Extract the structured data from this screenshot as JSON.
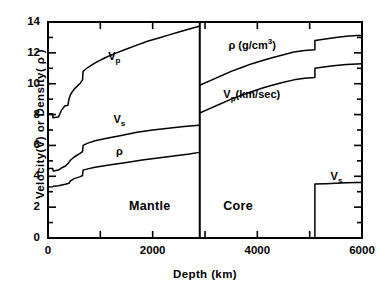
{
  "chart_data": {
    "type": "line",
    "title": "",
    "xlabel": "Depth  (km)",
    "ylabel": "Velocity(V) or Density( ρ )",
    "xlim": [
      0,
      6000
    ],
    "ylim": [
      0,
      14
    ],
    "grid": false,
    "legend": "inline-annotations",
    "xticks_major": [
      0,
      2000,
      4000,
      6000
    ],
    "xtick_labels": [
      "0",
      "2000",
      "4000",
      "6000"
    ],
    "xticks_minor": [
      1000,
      3000,
      5000
    ],
    "yticks_major": [
      0,
      2,
      4,
      6,
      8,
      10,
      12,
      14
    ],
    "ytick_labels": [
      "0",
      "2",
      "4",
      "6",
      "8",
      "10",
      "12",
      "14"
    ],
    "yticks_minor": [
      1,
      3,
      5,
      7,
      9,
      11,
      13
    ],
    "annotations": [
      {
        "name": "vp-mantle-label",
        "text": "V",
        "sub": "p",
        "x": 1150,
        "y": 11.7
      },
      {
        "name": "vs-mantle-label",
        "text": "V",
        "sub": "s",
        "x": 1250,
        "y": 7.6
      },
      {
        "name": "rho-mantle-label",
        "text": "ρ",
        "x": 1300,
        "y": 5.5
      },
      {
        "name": "rho-core-label",
        "text": "ρ (g/cm",
        "sup": "3",
        "suffix": ")",
        "x": 3450,
        "y": 12.5
      },
      {
        "name": "vp-core-label",
        "text": "V",
        "sub": "p",
        "suffix": "(km/sec)",
        "x": 3350,
        "y": 9.2
      },
      {
        "name": "vs-core-label",
        "text": "V",
        "sub": "s",
        "x": 5400,
        "y": 3.9
      },
      {
        "name": "mantle-region-label",
        "text": "Mantle",
        "x": 1550,
        "y": 2.0
      },
      {
        "name": "core-region-label",
        "text": "Core",
        "x": 3350,
        "y": 2.0
      }
    ],
    "boundaries": {
      "mantle_core_km": 2900,
      "inner_core_km": 5100
    },
    "series": [
      {
        "name": "Vp mantle",
        "symbol": "Vp",
        "region": "mantle",
        "unit": "km/sec",
        "points": [
          [
            0,
            8.05
          ],
          [
            90,
            8.05
          ],
          [
            95,
            7.8
          ],
          [
            200,
            7.85
          ],
          [
            260,
            8.3
          ],
          [
            320,
            8.55
          ],
          [
            380,
            8.6
          ],
          [
            400,
            9.0
          ],
          [
            430,
            9.3
          ],
          [
            500,
            9.65
          ],
          [
            620,
            10.05
          ],
          [
            660,
            10.25
          ],
          [
            670,
            10.8
          ],
          [
            760,
            11.05
          ],
          [
            900,
            11.35
          ],
          [
            1100,
            11.7
          ],
          [
            1300,
            11.98
          ],
          [
            1500,
            12.25
          ],
          [
            1700,
            12.5
          ],
          [
            1900,
            12.75
          ],
          [
            2100,
            12.95
          ],
          [
            2300,
            13.15
          ],
          [
            2500,
            13.35
          ],
          [
            2700,
            13.55
          ],
          [
            2890,
            13.72
          ]
        ]
      },
      {
        "name": "Vs mantle",
        "symbol": "Vs",
        "region": "mantle",
        "unit": "km/sec",
        "points": [
          [
            0,
            4.5
          ],
          [
            90,
            4.5
          ],
          [
            100,
            4.35
          ],
          [
            200,
            4.4
          ],
          [
            260,
            4.55
          ],
          [
            330,
            4.65
          ],
          [
            400,
            4.9
          ],
          [
            430,
            5.05
          ],
          [
            500,
            5.25
          ],
          [
            620,
            5.5
          ],
          [
            660,
            5.6
          ],
          [
            670,
            6.0
          ],
          [
            760,
            6.15
          ],
          [
            900,
            6.3
          ],
          [
            1100,
            6.45
          ],
          [
            1400,
            6.65
          ],
          [
            1700,
            6.85
          ],
          [
            2000,
            7.0
          ],
          [
            2300,
            7.12
          ],
          [
            2600,
            7.22
          ],
          [
            2890,
            7.3
          ]
        ]
      },
      {
        "name": "rho mantle",
        "symbol": "ρ",
        "region": "mantle",
        "unit": "g/cm3",
        "points": [
          [
            0,
            3.3
          ],
          [
            90,
            3.32
          ],
          [
            100,
            3.35
          ],
          [
            200,
            3.38
          ],
          [
            330,
            3.48
          ],
          [
            400,
            3.55
          ],
          [
            430,
            3.7
          ],
          [
            500,
            3.85
          ],
          [
            620,
            3.98
          ],
          [
            660,
            4.05
          ],
          [
            670,
            4.4
          ],
          [
            760,
            4.48
          ],
          [
            900,
            4.58
          ],
          [
            1200,
            4.75
          ],
          [
            1500,
            4.9
          ],
          [
            1800,
            5.05
          ],
          [
            2100,
            5.18
          ],
          [
            2400,
            5.32
          ],
          [
            2700,
            5.45
          ],
          [
            2890,
            5.55
          ]
        ]
      },
      {
        "name": "rho core",
        "symbol": "ρ",
        "region": "core",
        "unit": "g/cm3",
        "points": [
          [
            2900,
            9.9
          ],
          [
            3100,
            10.2
          ],
          [
            3300,
            10.5
          ],
          [
            3500,
            10.8
          ],
          [
            3700,
            11.05
          ],
          [
            3900,
            11.3
          ],
          [
            4100,
            11.5
          ],
          [
            4300,
            11.7
          ],
          [
            4500,
            11.88
          ],
          [
            4700,
            12.05
          ],
          [
            4900,
            12.15
          ],
          [
            5100,
            12.2
          ]
        ],
        "jump_at_km": 5100,
        "jump_to": 12.8,
        "points_after": [
          [
            5100,
            12.8
          ],
          [
            5300,
            12.9
          ],
          [
            5500,
            13.0
          ],
          [
            5700,
            13.08
          ],
          [
            5900,
            13.12
          ],
          [
            6000,
            13.13
          ]
        ]
      },
      {
        "name": "Vp core",
        "symbol": "Vp",
        "region": "core",
        "unit": "km/sec",
        "points": [
          [
            2900,
            8.1
          ],
          [
            3100,
            8.4
          ],
          [
            3300,
            8.7
          ],
          [
            3500,
            9.0
          ],
          [
            3700,
            9.25
          ],
          [
            3900,
            9.5
          ],
          [
            4100,
            9.72
          ],
          [
            4300,
            9.92
          ],
          [
            4500,
            10.1
          ],
          [
            4700,
            10.25
          ],
          [
            4900,
            10.35
          ],
          [
            5100,
            10.4
          ]
        ],
        "jump_at_km": 5100,
        "jump_to": 11.0,
        "points_after": [
          [
            5100,
            11.0
          ],
          [
            5300,
            11.1
          ],
          [
            5500,
            11.18
          ],
          [
            5700,
            11.24
          ],
          [
            5900,
            11.28
          ],
          [
            6000,
            11.3
          ]
        ]
      },
      {
        "name": "Vs inner core",
        "symbol": "Vs",
        "region": "inner core",
        "unit": "km/sec",
        "points": [
          [
            5100,
            0.0
          ],
          [
            5100,
            3.5
          ],
          [
            5300,
            3.52
          ],
          [
            5500,
            3.55
          ],
          [
            5700,
            3.58
          ],
          [
            5900,
            3.6
          ],
          [
            6000,
            3.6
          ]
        ]
      }
    ]
  }
}
